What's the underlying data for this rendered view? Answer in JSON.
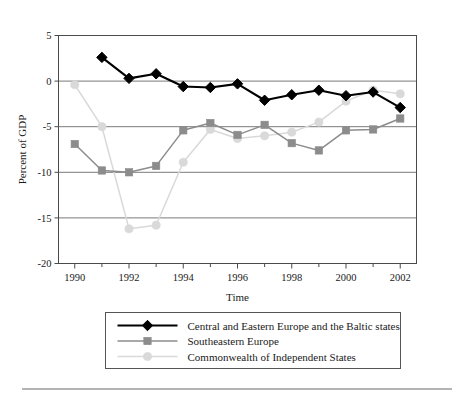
{
  "figure": {
    "background": "#ffffff",
    "has_footer_rule": true
  },
  "axes": {
    "ylabel": "Percent of GDP",
    "xlabel": "Time",
    "y_ticks": [
      "5",
      "0",
      "-5",
      "-10",
      "-15",
      "-20"
    ],
    "x_ticks": [
      "1990",
      "1992",
      "1994",
      "1996",
      "1998",
      "2000",
      "2002"
    ]
  },
  "legend": {
    "entries": [
      {
        "label": "Central and Eastern Europe and the Baltic states",
        "marker": "diamond-marker",
        "color": "#000000"
      },
      {
        "label": "Southeastern Europe",
        "marker": "square-marker",
        "color": "#8c8c8c"
      },
      {
        "label": "Commonwealth of Independent States",
        "marker": "circle-marker",
        "color": "#d9d9d9"
      }
    ]
  },
  "chart_data": {
    "type": "line",
    "title": "",
    "xlabel": "Time",
    "ylabel": "Percent of GDP",
    "xlim": [
      1989.4,
      2002.6
    ],
    "ylim": [
      -20,
      5
    ],
    "grid": true,
    "grid_axis": "y",
    "legend_position": "bottom",
    "x": [
      1990,
      1991,
      1992,
      1993,
      1994,
      1995,
      1996,
      1997,
      1998,
      1999,
      2000,
      2001,
      2002
    ],
    "series": [
      {
        "name": "Central and Eastern Europe and the Baltic states",
        "color": "#000000",
        "marker": "diamond",
        "values": [
          null,
          2.6,
          0.3,
          0.8,
          -0.6,
          -0.7,
          -0.3,
          -2.1,
          -1.5,
          -1.0,
          -1.6,
          -1.2,
          -2.9
        ]
      },
      {
        "name": "Southeastern Europe",
        "color": "#8c8c8c",
        "marker": "square",
        "values": [
          -6.9,
          -9.8,
          -10.0,
          -9.3,
          -5.4,
          -4.6,
          -5.9,
          -4.8,
          -6.8,
          -7.6,
          -5.4,
          -5.3,
          -4.1
        ]
      },
      {
        "name": "Commonwealth of Independent States",
        "color": "#d9d9d9",
        "marker": "circle",
        "values": [
          -0.4,
          -5.0,
          -16.2,
          -15.8,
          -8.9,
          -5.3,
          -6.3,
          -6.0,
          -5.6,
          -4.5,
          -2.2,
          -1.0,
          -1.4
        ]
      }
    ]
  }
}
